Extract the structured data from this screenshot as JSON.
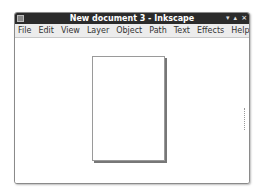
{
  "window": {
    "title": "New document 3 - Inkscape",
    "controls": [
      "minimize",
      "maximize",
      "close"
    ]
  },
  "menubar": {
    "items": [
      {
        "label": "File",
        "mnemonic": "F"
      },
      {
        "label": "Edit",
        "mnemonic": "E"
      },
      {
        "label": "View",
        "mnemonic": "V"
      },
      {
        "label": "Layer",
        "mnemonic": "L"
      },
      {
        "label": "Object",
        "mnemonic": "O"
      },
      {
        "label": "Path",
        "mnemonic": "P"
      },
      {
        "label": "Text",
        "mnemonic": "T"
      },
      {
        "label": "Effects",
        "mnemonic": "c"
      },
      {
        "label": "Help",
        "mnemonic": "H"
      }
    ]
  },
  "icons": {
    "minimize": "▾",
    "maximize": "▴",
    "close": "×"
  }
}
